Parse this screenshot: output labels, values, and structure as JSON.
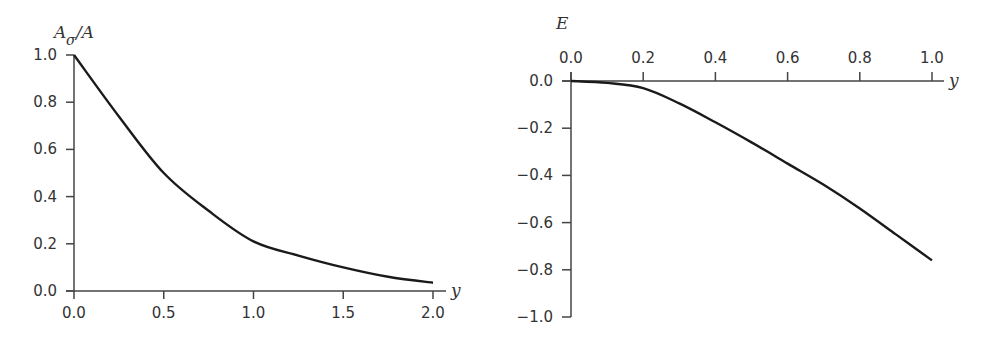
{
  "chart_data": [
    {
      "type": "line",
      "title": "",
      "xlabel": "y",
      "ylabel": "A_σ/A",
      "ylabel_main": "A",
      "ylabel_sub": "σ",
      "ylabel_tail": "/A",
      "xlim": [
        0,
        2.0
      ],
      "ylim": [
        0,
        1.0
      ],
      "xticks": [
        "0.0",
        "0.5",
        "1.0",
        "1.5",
        "2.0"
      ],
      "yticks": [
        "0.0",
        "0.2",
        "0.4",
        "0.6",
        "0.8",
        "1.0"
      ],
      "grid": false,
      "legend": null,
      "series": [
        {
          "name": "A_sigma/A",
          "x": [
            0.0,
            0.25,
            0.5,
            0.75,
            1.0,
            1.25,
            1.5,
            1.75,
            2.0
          ],
          "y": [
            1.0,
            0.74,
            0.5,
            0.34,
            0.21,
            0.15,
            0.1,
            0.06,
            0.035
          ]
        }
      ]
    },
    {
      "type": "line",
      "title": "",
      "xlabel": "y",
      "ylabel": "E",
      "xlim": [
        0,
        1.0
      ],
      "ylim": [
        -1.0,
        0.0
      ],
      "xticks": [
        "0.0",
        "0.2",
        "0.4",
        "0.6",
        "0.8",
        "1.0"
      ],
      "yticks": [
        "0.0",
        "−0.2",
        "−0.4",
        "−0.6",
        "−0.8",
        "−1.0"
      ],
      "x_axis_position": "top (at E=0)",
      "grid": false,
      "legend": null,
      "series": [
        {
          "name": "E",
          "x": [
            0.0,
            0.1,
            0.2,
            0.3,
            0.4,
            0.5,
            0.6,
            0.7,
            0.8,
            0.9,
            1.0
          ],
          "y": [
            0.0,
            -0.008,
            -0.03,
            -0.095,
            -0.175,
            -0.26,
            -0.35,
            -0.44,
            -0.54,
            -0.65,
            -0.76
          ]
        }
      ]
    }
  ]
}
